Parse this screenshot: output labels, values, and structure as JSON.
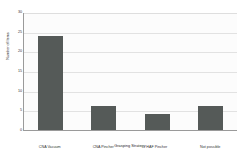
{
  "chart_data": {
    "type": "bar",
    "title": "",
    "xlabel": "Grasping Strategy",
    "ylabel": "Number of Items",
    "categories": [
      "CNA Vacuum",
      "CNA Pincher",
      "HAF Pincher",
      "Not possible"
    ],
    "values": [
      24,
      6,
      4,
      6
    ],
    "ylim": [
      0,
      30
    ],
    "yticks": [
      0,
      5,
      10,
      15,
      20,
      25,
      30
    ],
    "ytick_labels": [
      "0",
      "5",
      "10",
      "15",
      "20",
      "25",
      "30"
    ],
    "grid": true,
    "legend": null,
    "bar_color": "#555a58",
    "plot_background": "#fcfcfc",
    "gridline_color": "#e2e2e2",
    "axis_color": "#9a9a9a"
  }
}
